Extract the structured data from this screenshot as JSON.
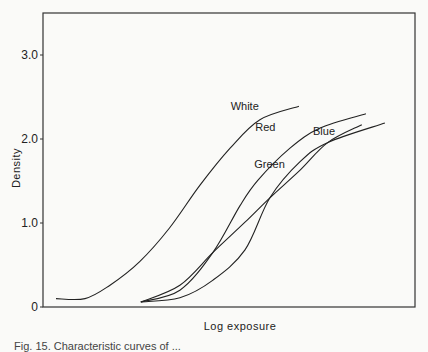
{
  "chart_data": {
    "type": "line",
    "title": "",
    "xlabel": "Log exposure",
    "ylabel": "Density",
    "ylim": [
      0,
      3.5
    ],
    "xlim": [
      0,
      10
    ],
    "x_units_note": "relative (no x tick labels shown)",
    "yticks": [
      {
        "value": 0,
        "label": "0"
      },
      {
        "value": 1.0,
        "label": "1.0"
      },
      {
        "value": 2.0,
        "label": "2.0"
      },
      {
        "value": 3.0,
        "label": "3.0"
      }
    ],
    "grid": false,
    "legend": "inline labels",
    "series": [
      {
        "name": "White",
        "label_pos": [
          5.8,
          2.35
        ],
        "x": [
          0.35,
          1.13,
          1.8,
          2.6,
          3.4,
          4.22,
          5.03,
          5.83,
          6.88
        ],
        "values": [
          0.1,
          0.1,
          0.26,
          0.54,
          0.94,
          1.45,
          1.89,
          2.23,
          2.39
        ]
      },
      {
        "name": "Red",
        "label_pos": [
          6.25,
          2.1
        ],
        "x": [
          2.63,
          3.68,
          4.57,
          5.3,
          5.78,
          6.64,
          7.45,
          8.68
        ],
        "values": [
          0.06,
          0.2,
          0.65,
          1.21,
          1.51,
          1.89,
          2.13,
          2.3
        ]
      },
      {
        "name": "Green",
        "label_pos": [
          6.5,
          1.65
        ],
        "x": [
          2.63,
          3.68,
          4.57,
          5.43,
          6.1,
          6.91,
          7.66,
          9.19
        ],
        "values": [
          0.06,
          0.11,
          0.32,
          0.68,
          1.3,
          1.73,
          1.96,
          2.19
        ]
      },
      {
        "name": "Blue",
        "label_pos": [
          7.85,
          2.05
        ],
        "x": [
          2.63,
          3.68,
          4.57,
          5.43,
          6.1,
          6.91,
          7.66,
          8.57
        ],
        "values": [
          0.06,
          0.26,
          0.65,
          1.01,
          1.3,
          1.63,
          1.96,
          2.17
        ]
      }
    ]
  },
  "caption": "Fig. 15.  Characteristic curves of ..."
}
